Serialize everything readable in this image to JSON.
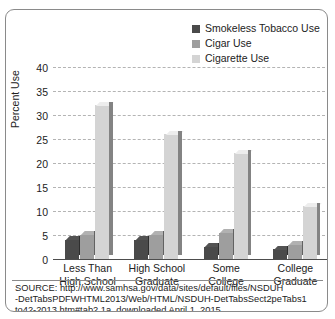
{
  "chart_data": {
    "type": "bar",
    "title": "",
    "xlabel": "",
    "ylabel": "Percent Use",
    "ylim": [
      0,
      40
    ],
    "ytick_step": 5,
    "yticks": [
      "40",
      "35",
      "30",
      "25",
      "20",
      "15",
      "10",
      "5",
      "0"
    ],
    "grid": true,
    "legend_position": "top-right",
    "categories": [
      "Less Than\nHigh School",
      "High School\nGraduate",
      "Some\nCollege",
      "College\nGraduate"
    ],
    "category_lines": [
      [
        "Less Than",
        "High School"
      ],
      [
        "High School",
        "Graduate"
      ],
      [
        "Some",
        "College"
      ],
      [
        "College",
        "Graduate"
      ]
    ],
    "series": [
      {
        "name": "Smokeless Tobacco Use",
        "color": "#4a4a4a",
        "values": [
          4,
          4,
          2.5,
          2
        ]
      },
      {
        "name": "Cigar Use",
        "color": "#9e9e9e",
        "values": [
          5,
          5,
          5.5,
          3
        ]
      },
      {
        "name": "Cigarette Use",
        "color": "#d4d4d4",
        "values": [
          32,
          26,
          22,
          11
        ]
      }
    ]
  },
  "legend": {
    "items": [
      {
        "label": "Smokeless Tobacco Use",
        "color": "#4a4a4a"
      },
      {
        "label": "Cigar Use",
        "color": "#9e9e9e"
      },
      {
        "label": "Cigarette Use",
        "color": "#d4d4d4"
      }
    ]
  },
  "source": {
    "lines": [
      "SOURCE: http://www.samhsa.gov/data/sites/default/files/NSDUH",
      "-DetTabsPDFWHTML2013/Web/HTML/NSDUH-DetTabsSect2peTabs1",
      "to42-2013.htm#tab2.1a, downloaded April 1, 2015."
    ]
  }
}
